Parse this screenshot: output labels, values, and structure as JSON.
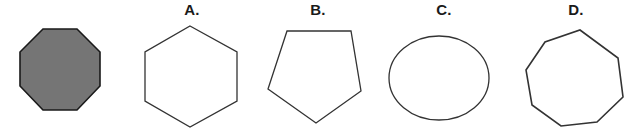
{
  "question": {
    "type": "shape-matching-multiple-choice",
    "prompt_shape": {
      "name": "filled-octagon",
      "sides": 8,
      "fill_color": "#757575",
      "stroke_color": "#1a1a1a",
      "stroke_width": 1.5,
      "orientation": "flat-top",
      "label": ""
    },
    "options": [
      {
        "key": "A",
        "label": "A.",
        "shape_name": "hexagon",
        "sides": 6,
        "fill_color": "#ffffff",
        "stroke_color": "#333333",
        "stroke_width": 1.3,
        "orientation": "pointy-top"
      },
      {
        "key": "B",
        "label": "B.",
        "shape_name": "pentagon",
        "sides": 5,
        "fill_color": "#ffffff",
        "stroke_color": "#333333",
        "stroke_width": 1.3,
        "orientation": "flat-top-apex-down"
      },
      {
        "key": "C",
        "label": "C.",
        "shape_name": "ellipse",
        "sides": 0,
        "fill_color": "#ffffff",
        "stroke_color": "#333333",
        "stroke_width": 1.3,
        "orientation": "horizontal"
      },
      {
        "key": "D",
        "label": "D.",
        "shape_name": "octagon",
        "sides": 8,
        "fill_color": "#ffffff",
        "stroke_color": "#333333",
        "stroke_width": 1.6,
        "orientation": "rotated"
      }
    ]
  },
  "canvas": {
    "background_color": "#ffffff",
    "width": 644,
    "height": 132
  }
}
